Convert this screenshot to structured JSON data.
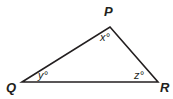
{
  "diagram": {
    "type": "triangle",
    "vertices": {
      "P": {
        "label": "P",
        "x": 110,
        "y": 27
      },
      "Q": {
        "label": "Q",
        "x": 22,
        "y": 82
      },
      "R": {
        "label": "R",
        "x": 158,
        "y": 82
      }
    },
    "angles": {
      "P": "x°",
      "Q": "y°",
      "R": "z°"
    },
    "stroke_color": "#231f20"
  }
}
